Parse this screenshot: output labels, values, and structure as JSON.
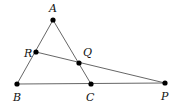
{
  "diagram": {
    "type": "geometry",
    "points": [
      {
        "id": "A",
        "label": "A",
        "x": 53,
        "y": 20,
        "lx": 49,
        "ly": 12
      },
      {
        "id": "B",
        "label": "B",
        "x": 17,
        "y": 84,
        "lx": 13,
        "ly": 101
      },
      {
        "id": "C",
        "label": "C",
        "x": 91,
        "y": 84,
        "lx": 86,
        "ly": 101
      },
      {
        "id": "P",
        "label": "P",
        "x": 165,
        "y": 83,
        "lx": 161,
        "ly": 100
      },
      {
        "id": "Q",
        "label": "Q",
        "x": 79,
        "y": 63,
        "lx": 83,
        "ly": 56
      },
      {
        "id": "R",
        "label": "R",
        "x": 36,
        "y": 52,
        "lx": 24,
        "ly": 57
      }
    ],
    "segments": [
      {
        "from": "A",
        "to": "B"
      },
      {
        "from": "A",
        "to": "C"
      },
      {
        "from": "B",
        "to": "P"
      },
      {
        "from": "R",
        "to": "P"
      }
    ],
    "colors": {
      "line": "#555555",
      "point": "#000000",
      "label": "#111111"
    }
  }
}
